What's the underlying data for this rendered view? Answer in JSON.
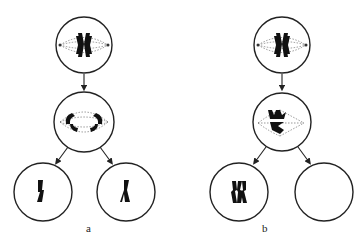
{
  "diagram": {
    "panels": [
      {
        "id": "a",
        "label": "a",
        "stages": [
          {
            "name": "metaphase",
            "chromosomes": "homologous pair aligned at equator with spindle"
          },
          {
            "name": "anaphase",
            "chromosomes": "homologs separating to both poles"
          },
          {
            "name": "daughter-cell-left",
            "chromosomes": "one chromosome"
          },
          {
            "name": "daughter-cell-right",
            "chromosomes": "one chromosome"
          }
        ]
      },
      {
        "id": "b",
        "label": "b",
        "stages": [
          {
            "name": "metaphase",
            "chromosomes": "homologous pair aligned at equator with spindle"
          },
          {
            "name": "anaphase",
            "chromosomes": "both homologs moving to one pole (nondisjunction)"
          },
          {
            "name": "daughter-cell-left",
            "chromosomes": "two chromosomes"
          },
          {
            "name": "daughter-cell-right",
            "chromosomes": "none (empty)"
          }
        ]
      }
    ]
  }
}
